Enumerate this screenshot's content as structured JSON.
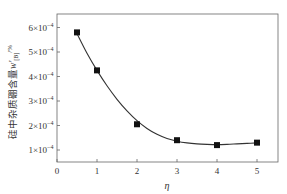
{
  "chart_data": {
    "type": "line",
    "title": "",
    "xlabel": "η",
    "ylabel": "硅中杂质硼含量w'[B]/%",
    "ylabel_parts": {
      "main": "硅中杂质硼含量",
      "var": "w'",
      "sub": "[B]",
      "unit": "/%"
    },
    "xlim": [
      0,
      5.5
    ],
    "ylim": [
      5e-05,
      0.00065
    ],
    "x_ticks": [
      0,
      1,
      2,
      3,
      4,
      5
    ],
    "x_tick_labels": [
      "0",
      "1",
      "2",
      "3",
      "4",
      "5"
    ],
    "y_ticks": [
      0.0001,
      0.0002,
      0.0003,
      0.0004,
      0.0005,
      0.0006
    ],
    "y_tick_labels": [
      {
        "mant": "1×10",
        "exp": "−4"
      },
      {
        "mant": "2×10",
        "exp": "−4"
      },
      {
        "mant": "3×10",
        "exp": "−4"
      },
      {
        "mant": "4×10",
        "exp": "−4"
      },
      {
        "mant": "5×10",
        "exp": "−4"
      },
      {
        "mant": "6×10",
        "exp": "−4"
      }
    ],
    "grid": false,
    "legend": null,
    "series": [
      {
        "name": "boron content",
        "marker": "square",
        "fit_curve": true,
        "x": [
          0.5,
          1,
          2,
          3,
          4,
          5
        ],
        "values": [
          0.00058,
          0.000425,
          0.000205,
          0.00014,
          0.00012,
          0.00013
        ]
      }
    ],
    "fit_curve_points": {
      "x": [
        0.5,
        0.75,
        1,
        1.25,
        1.5,
        1.75,
        2,
        2.25,
        2.5,
        2.75,
        3,
        3.25,
        3.5,
        3.75,
        4,
        4.25,
        4.5,
        4.75,
        5
      ],
      "values": [
        0.000575,
        0.000495,
        0.000425,
        0.000362,
        0.000307,
        0.00026,
        0.00022,
        0.000188,
        0.000164,
        0.000147,
        0.000136,
        0.000129,
        0.000125,
        0.000123,
        0.000122,
        0.000123,
        0.000125,
        0.000127,
        0.000129
      ]
    },
    "colors": {
      "line": "#333333",
      "marker": "#111111",
      "axis": "#555555"
    }
  }
}
